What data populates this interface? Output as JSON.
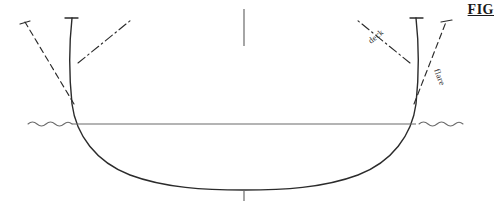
{
  "figure": {
    "caption": "FIG",
    "background_color": "#ffffff",
    "line_color": "#2b2b2b",
    "waterline_color": "#555555"
  },
  "labels": {
    "deck": "deck",
    "flare": "flare"
  },
  "diagram": {
    "elements": [
      "hull-section-curve",
      "waterline",
      "centerline-tick-top",
      "centerline-tick-bottom",
      "deck-line-left",
      "deck-line-right",
      "flare-line-left",
      "flare-line-right",
      "topside-left",
      "topside-right",
      "water-symbol-left",
      "water-symbol-right"
    ]
  }
}
